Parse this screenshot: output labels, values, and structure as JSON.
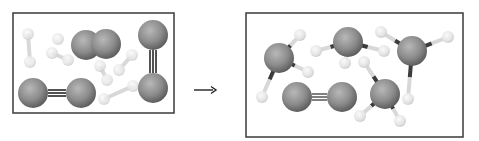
{
  "diagram": {
    "colors": {
      "border": "#3a3a3a",
      "large_atom": "#8a8a8a",
      "small_atom": "#e6e6e6",
      "small_atom_reactant": "#ececec",
      "bond_dark": "#3c3c3c",
      "bond_light": "#d8d8d8",
      "arrow": "#222222"
    },
    "reactants_box": {
      "x": 13,
      "y": 13,
      "w": 161,
      "h": 100,
      "large_atoms": [
        {
          "cx": 86,
          "cy": 45,
          "r": 15
        },
        {
          "cx": 106,
          "cy": 44,
          "r": 15
        },
        {
          "cx": 153,
          "cy": 35,
          "r": 15
        },
        {
          "cx": 153,
          "cy": 88,
          "r": 15
        },
        {
          "cx": 33,
          "cy": 93,
          "r": 15
        },
        {
          "cx": 81,
          "cy": 93,
          "r": 15
        }
      ],
      "triple_bonds": [
        {
          "x1": 48,
          "y1": 93,
          "x2": 66,
          "y2": 93,
          "orient": "h"
        },
        {
          "x1": 153,
          "y1": 50,
          "x2": 153,
          "y2": 73,
          "orient": "v"
        }
      ],
      "small_atoms": [
        {
          "cx": 28,
          "cy": 34,
          "r": 6
        },
        {
          "cx": 30,
          "cy": 62,
          "r": 6
        },
        {
          "cx": 58,
          "cy": 39,
          "r": 6
        },
        {
          "cx": 52,
          "cy": 53,
          "r": 6
        },
        {
          "cx": 68,
          "cy": 60,
          "r": 6
        },
        {
          "cx": 100,
          "cy": 66,
          "r": 6
        },
        {
          "cx": 107,
          "cy": 80,
          "r": 6
        },
        {
          "cx": 132,
          "cy": 55,
          "r": 6
        },
        {
          "cx": 119,
          "cy": 70,
          "r": 6
        },
        {
          "cx": 104,
          "cy": 99,
          "r": 6
        },
        {
          "cx": 133,
          "cy": 86,
          "r": 6
        }
      ],
      "light_bonds": [
        {
          "x1": 28,
          "y1": 34,
          "x2": 30,
          "y2": 62
        },
        {
          "x1": 52,
          "y1": 53,
          "x2": 68,
          "y2": 60
        },
        {
          "x1": 100,
          "y1": 66,
          "x2": 107,
          "y2": 80
        },
        {
          "x1": 132,
          "y1": 55,
          "x2": 119,
          "y2": 70
        },
        {
          "x1": 104,
          "y1": 99,
          "x2": 133,
          "y2": 86
        }
      ]
    },
    "arrow": {
      "x1": 194,
      "y1": 90,
      "x2": 216,
      "y2": 90,
      "label": "→"
    },
    "products_box": {
      "x": 246,
      "y": 13,
      "w": 217,
      "h": 124,
      "ammonia": [
        {
          "n": {
            "cx": 279,
            "cy": 58,
            "r": 15
          },
          "h": [
            {
              "cx": 300,
              "cy": 35
            },
            {
              "cx": 308,
              "cy": 72
            },
            {
              "cx": 262,
              "cy": 97
            }
          ]
        },
        {
          "n": {
            "cx": 348,
            "cy": 42,
            "r": 15
          },
          "h": [
            {
              "cx": 316,
              "cy": 51
            },
            {
              "cx": 384,
              "cy": 51
            },
            {
              "cx": 345,
              "cy": 63
            }
          ]
        },
        {
          "n": {
            "cx": 412,
            "cy": 51,
            "r": 15
          },
          "h": [
            {
              "cx": 381,
              "cy": 32
            },
            {
              "cx": 448,
              "cy": 37
            },
            {
              "cx": 408,
              "cy": 99
            }
          ]
        },
        {
          "n": {
            "cx": 385,
            "cy": 94,
            "r": 15
          },
          "h": [
            {
              "cx": 364,
              "cy": 62
            },
            {
              "cx": 360,
              "cy": 116
            },
            {
              "cx": 400,
              "cy": 121
            }
          ]
        }
      ],
      "nitrogen": {
        "atoms": [
          {
            "cx": 297,
            "cy": 97,
            "r": 15
          },
          {
            "cx": 342,
            "cy": 97,
            "r": 15
          }
        ],
        "triple_bond": {
          "x1": 312,
          "y1": 97,
          "x2": 327,
          "y2": 97
        }
      },
      "h_radius": 6
    }
  }
}
